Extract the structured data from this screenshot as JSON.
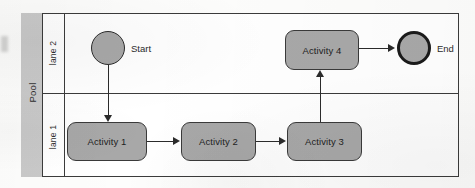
{
  "diagram": {
    "type": "bpmn-swimlane",
    "pool": {
      "label": "Pool"
    },
    "lanes": [
      {
        "id": "lane2",
        "label": "lane 2"
      },
      {
        "id": "lane1",
        "label": "lane 1"
      }
    ],
    "nodes": {
      "start": {
        "label": "Start",
        "shape": "circle",
        "lane": "lane 2"
      },
      "end": {
        "label": "End",
        "shape": "circle-thick",
        "lane": "lane 2"
      },
      "activity1": {
        "label": "Activity 1",
        "shape": "rounded-rect",
        "lane": "lane 1"
      },
      "activity2": {
        "label": "Activity 2",
        "shape": "rounded-rect",
        "lane": "lane 1"
      },
      "activity3": {
        "label": "Activity 3",
        "shape": "rounded-rect",
        "lane": "lane 1"
      },
      "activity4": {
        "label": "Activity 4",
        "shape": "rounded-rect",
        "lane": "lane 2"
      }
    },
    "flows": [
      {
        "from": "Start",
        "to": "Activity 1",
        "direction": "down"
      },
      {
        "from": "Activity 1",
        "to": "Activity 2",
        "direction": "right"
      },
      {
        "from": "Activity 2",
        "to": "Activity 3",
        "direction": "right"
      },
      {
        "from": "Activity 3",
        "to": "Activity 4",
        "direction": "up"
      },
      {
        "from": "Activity 4",
        "to": "End",
        "direction": "right"
      }
    ],
    "colors": {
      "node_fill": "#a8a8a8",
      "pool_band": "#c9c9c9",
      "stroke": "#3b3b3b",
      "background": "#ffffff"
    }
  }
}
